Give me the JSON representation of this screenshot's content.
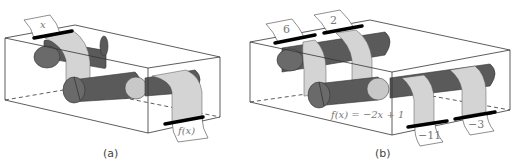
{
  "figure": {
    "panels": [
      {
        "caption": "(a)",
        "input_label": "x",
        "output_label": "f(x)"
      },
      {
        "caption": "(b)",
        "inputs": [
          "6",
          "2"
        ],
        "function_label": "f(x) = −2x + 1",
        "outputs": [
          "−11",
          "−3"
        ]
      }
    ],
    "colors": {
      "cylinder": "#5a5a5a",
      "tape": "#d4d4d4",
      "paper": "#ffffff",
      "slot": "#000000"
    }
  }
}
